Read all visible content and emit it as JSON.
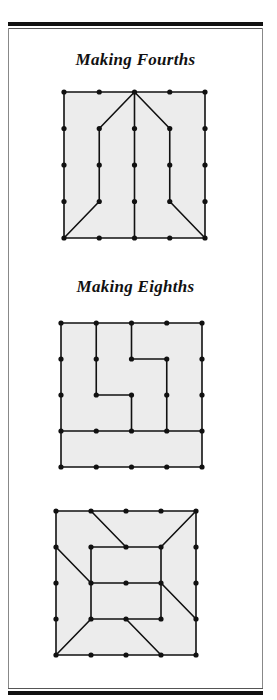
{
  "page": {
    "titles": [
      "Making Fourths",
      "Making Eighths"
    ]
  },
  "diagrams": [
    {
      "name": "fourths-geoboard",
      "origin": [
        64,
        92
      ],
      "step": [
        35.25,
        36.5
      ],
      "size": 5,
      "segments": [
        [
          [
            0,
            0
          ],
          [
            4,
            0
          ]
        ],
        [
          [
            4,
            0
          ],
          [
            4,
            4
          ]
        ],
        [
          [
            4,
            4
          ],
          [
            0,
            4
          ]
        ],
        [
          [
            0,
            4
          ],
          [
            0,
            0
          ]
        ],
        [
          [
            2,
            0
          ],
          [
            2,
            4
          ]
        ],
        [
          [
            2,
            0
          ],
          [
            1,
            1
          ]
        ],
        [
          [
            1,
            1
          ],
          [
            1,
            3
          ]
        ],
        [
          [
            1,
            3
          ],
          [
            0,
            4
          ]
        ],
        [
          [
            2,
            0
          ],
          [
            3,
            1
          ]
        ],
        [
          [
            3,
            1
          ],
          [
            3,
            3
          ]
        ],
        [
          [
            3,
            3
          ],
          [
            4,
            4
          ]
        ]
      ]
    },
    {
      "name": "eighths-geoboard-1",
      "origin": [
        61,
        323
      ],
      "step": [
        35.25,
        36
      ],
      "size": 5,
      "segments": [
        [
          [
            0,
            0
          ],
          [
            4,
            0
          ]
        ],
        [
          [
            4,
            0
          ],
          [
            4,
            4
          ]
        ],
        [
          [
            4,
            4
          ],
          [
            0,
            4
          ]
        ],
        [
          [
            0,
            4
          ],
          [
            0,
            0
          ]
        ],
        [
          [
            0,
            3
          ],
          [
            4,
            3
          ]
        ],
        [
          [
            1,
            0
          ],
          [
            1,
            2
          ]
        ],
        [
          [
            1,
            2
          ],
          [
            2,
            2
          ]
        ],
        [
          [
            2,
            2
          ],
          [
            2,
            3
          ]
        ],
        [
          [
            2,
            0
          ],
          [
            2,
            1
          ]
        ],
        [
          [
            2,
            1
          ],
          [
            3,
            1
          ]
        ],
        [
          [
            3,
            1
          ],
          [
            3,
            3
          ]
        ]
      ]
    },
    {
      "name": "eighths-geoboard-2",
      "origin": [
        56,
        511
      ],
      "step": [
        35,
        36
      ],
      "size": 5,
      "segments": [
        [
          [
            0,
            0
          ],
          [
            4,
            0
          ]
        ],
        [
          [
            4,
            0
          ],
          [
            4,
            4
          ]
        ],
        [
          [
            4,
            4
          ],
          [
            0,
            4
          ]
        ],
        [
          [
            0,
            4
          ],
          [
            0,
            0
          ]
        ],
        [
          [
            1,
            1
          ],
          [
            3,
            1
          ]
        ],
        [
          [
            3,
            1
          ],
          [
            3,
            3
          ]
        ],
        [
          [
            3,
            3
          ],
          [
            1,
            3
          ]
        ],
        [
          [
            1,
            3
          ],
          [
            1,
            1
          ]
        ],
        [
          [
            1,
            2
          ],
          [
            3,
            2
          ]
        ],
        [
          [
            1,
            0
          ],
          [
            2,
            1
          ]
        ],
        [
          [
            4,
            0
          ],
          [
            3,
            1
          ]
        ],
        [
          [
            0,
            1
          ],
          [
            1,
            2
          ]
        ],
        [
          [
            3,
            2
          ],
          [
            4,
            3
          ]
        ],
        [
          [
            1,
            3
          ],
          [
            0,
            4
          ]
        ],
        [
          [
            2,
            3
          ],
          [
            3,
            4
          ]
        ]
      ]
    }
  ]
}
